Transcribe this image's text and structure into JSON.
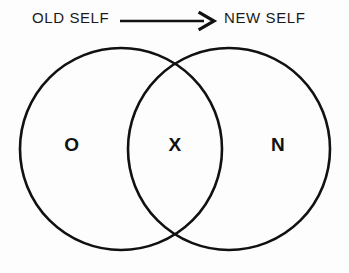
{
  "diagram": {
    "title_flow": {
      "from_label": "OLD SELF",
      "to_label": "NEW SELF",
      "arrow_icon": "arrow-right-icon"
    },
    "venn": {
      "left_circle_label": "O",
      "intersection_label": "X",
      "right_circle_label": "N"
    },
    "colors": {
      "stroke": "#111111",
      "background": "#fdfdfd",
      "text": "#1a1a1a"
    }
  }
}
